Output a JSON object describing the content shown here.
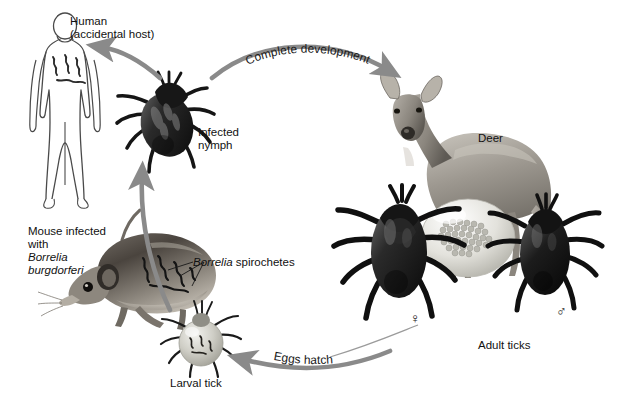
{
  "figure": {
    "type": "diagram",
    "background_color": "#ffffff",
    "arrow_color": "#8a8a8a",
    "line_color": "#333333"
  },
  "labels": {
    "human_line1": "Human",
    "human_line2": "(accidental host)",
    "infected_nymph_line1": "Infected",
    "infected_nymph_line2": "nymph",
    "deer": "Deer",
    "adult_ticks": "Adult ticks",
    "larval_tick": "Larval tick",
    "mouse_line1": "Mouse infected",
    "mouse_line2": "with",
    "mouse_line3_italic": "Borrelia",
    "mouse_line4_italic": "burgdorferi",
    "spirochetes_italic": "Borrelia",
    "spirochetes_rest": " spirochetes",
    "female_symbol": "♀",
    "male_symbol": "♂"
  },
  "arrows": {
    "complete_development": "Complete development",
    "eggs_hatch": "Eggs hatch"
  },
  "organisms": [
    {
      "name": "human",
      "role": "accidental host",
      "style": "line drawing outline"
    },
    {
      "name": "infected-nymph-tick",
      "role": "infected nymph",
      "style": "dark photographic tick"
    },
    {
      "name": "deer",
      "role": "adult tick host",
      "style": "grayscale photograph"
    },
    {
      "name": "adult-female-tick",
      "role": "adult female",
      "symbol": "♀"
    },
    {
      "name": "adult-male-tick",
      "role": "adult male",
      "symbol": "♂"
    },
    {
      "name": "egg-mass",
      "role": "eggs laid by female"
    },
    {
      "name": "larval-tick",
      "role": "larva feeding on mouse"
    },
    {
      "name": "mouse",
      "role": "reservoir host infected with Borrelia burgdorferi"
    }
  ]
}
